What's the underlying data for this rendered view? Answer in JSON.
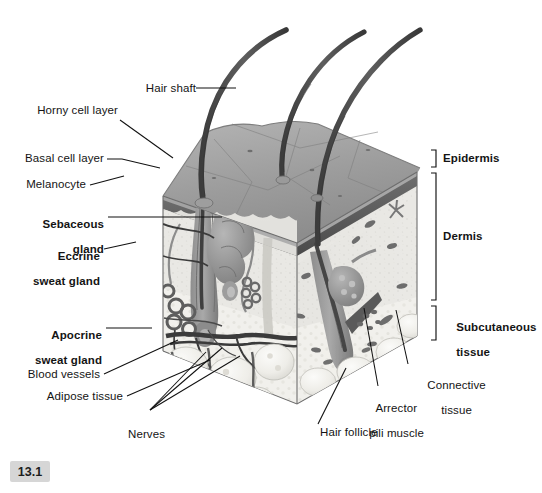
{
  "figure": {
    "number": "13.1",
    "style": "grayscale anatomical illustration, 3D cut-away block of skin"
  },
  "labels": {
    "hair_shaft": "Hair shaft",
    "horny_cell_layer": "Horny cell layer",
    "basal_cell_layer": "Basal cell layer",
    "melanocyte": "Melanocyte",
    "sebaceous_gland_l1": "Sebaceous",
    "sebaceous_gland_l2": "gland",
    "eccrine_l1": "Eccrine",
    "eccrine_l2": "sweat gland",
    "apocrine_l1": "Apocrine",
    "apocrine_l2": "sweat gland",
    "blood_vessels": "Blood vessels",
    "adipose_tissue": "Adipose tissue",
    "nerves": "Nerves",
    "hair_follicle": "Hair follicle",
    "arrector_l1": "Arrector",
    "arrector_l2": "pili muscle",
    "connective_l1": "Connective",
    "connective_l2": "tissue",
    "epidermis": "Epidermis",
    "dermis": "Dermis",
    "subcutaneous_l1": "Subcutaneous",
    "subcutaneous_l2": "tissue"
  },
  "colors": {
    "background": "#ffffff",
    "leader_line": "#111111",
    "text": "#141414",
    "figure_box": "#d6d6d6",
    "surface_top": "#9a9a9a",
    "surface_top_light": "#b0b0b0",
    "epidermis_band": "#5c5c5c",
    "dermis_fill": "#e8e8e6",
    "dermis_side": "#dedede",
    "subcutaneous_fill": "#f0efec",
    "hair_dark": "#4a4a4a",
    "gland_gray": "#8f8f8f",
    "vessel_dark": "#3a3a3a",
    "fat_lobule": "#efeeea"
  }
}
